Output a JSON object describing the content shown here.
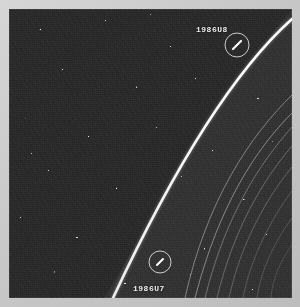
{
  "image": {
    "kind": "spacecraft-photograph",
    "subject": "Uranus rings with two shepherd moons",
    "frame_color": "#c9c9c9",
    "background_color": "#2b2b2b",
    "feature_color": "#f2f2f2",
    "width": 300,
    "height": 307
  },
  "annotations": [
    {
      "id": "moon-1986u8",
      "label": "1986U8",
      "label_x": 187,
      "label_y": 16,
      "circle_x": 228,
      "circle_y": 36,
      "circle_r": 12,
      "streak_angle": -35
    },
    {
      "id": "moon-1986u7",
      "label": "1986U7",
      "label_x": 124,
      "label_y": 275,
      "circle_x": 151,
      "circle_y": 253,
      "circle_r": 11,
      "streak_angle": -35
    }
  ],
  "rings": {
    "bright_ring_name": "epsilon-ring",
    "bright_ring_color": "#fdfdfd",
    "faint_ring_color": "#b4b4b4",
    "faint_ring_count": 7
  },
  "labels": {
    "upper_moon": "1986U8",
    "lower_moon": "1986U7"
  }
}
